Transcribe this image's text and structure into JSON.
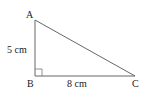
{
  "diagram": {
    "type": "right-triangle",
    "vertices": {
      "A": {
        "label": "A",
        "x": 35,
        "y": 20
      },
      "B": {
        "label": "B",
        "x": 35,
        "y": 76
      },
      "C": {
        "label": "C",
        "x": 135,
        "y": 76
      }
    },
    "sides": {
      "AB": {
        "label": "5 cm"
      },
      "BC": {
        "label": "8 cm"
      }
    },
    "right_angle_at": "B",
    "colors": {
      "stroke": "#555555",
      "text": "#222222",
      "background": "#ffffff"
    }
  }
}
